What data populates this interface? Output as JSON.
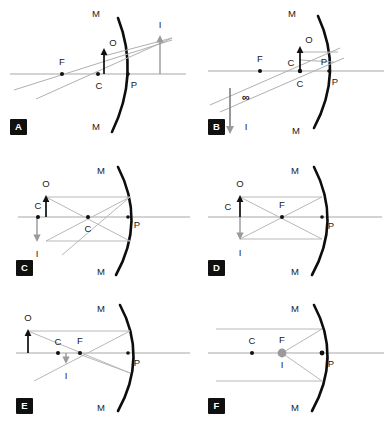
{
  "figure": {
    "colors": {
      "background": "#ffffff",
      "mirror": "#0d0d0d",
      "axis": "#a8a8a8",
      "ray": "#b0b0b0",
      "object_arrow": "#0d0d0d",
      "image_arrow": "#8f8f8f",
      "badge_background": "#101010",
      "badge_text": "#ffffff"
    },
    "symbols": {
      "mirror_top": "M",
      "mirror_bottom": "M",
      "centre_of_curvature": "C",
      "focal_point": "F",
      "pole": "P",
      "object": "O",
      "image": "I",
      "infinity": "∞"
    }
  },
  "panels": [
    {
      "id": "A",
      "badge": "A",
      "caption": "Object between F and P; virtual enlarged upright image",
      "labels": [
        {
          "name": "mirror-top",
          "text": "M"
        },
        {
          "name": "mirror-bottom",
          "text": "M"
        },
        {
          "name": "focal-point",
          "text": "F"
        },
        {
          "name": "centre",
          "text": "C"
        },
        {
          "name": "object",
          "text": "O"
        },
        {
          "name": "pole",
          "text": "P"
        },
        {
          "name": "image",
          "text": "I"
        }
      ]
    },
    {
      "id": "B",
      "badge": "B",
      "caption": "Object at F; reflected rays parallel, image at infinity",
      "labels": [
        {
          "name": "mirror-top",
          "text": "M"
        },
        {
          "name": "mirror-bottom",
          "text": "M"
        },
        {
          "name": "focal-point",
          "text": "F"
        },
        {
          "name": "centre-upper",
          "text": "C"
        },
        {
          "name": "centre-lower",
          "text": "C"
        },
        {
          "name": "object",
          "text": "O"
        },
        {
          "name": "pole-upper",
          "text": "P"
        },
        {
          "name": "pole-lower",
          "text": "P"
        },
        {
          "name": "infinity",
          "text": "∞"
        },
        {
          "name": "image",
          "text": "I"
        }
      ]
    },
    {
      "id": "C",
      "badge": "C",
      "caption": "Object beyond C; real inverted diminished image",
      "labels": [
        {
          "name": "mirror-top",
          "text": "M"
        },
        {
          "name": "mirror-bottom",
          "text": "M"
        },
        {
          "name": "centre-left",
          "text": "C"
        },
        {
          "name": "centre-mid",
          "text": "C"
        },
        {
          "name": "object",
          "text": "O"
        },
        {
          "name": "pole",
          "text": "P"
        },
        {
          "name": "image",
          "text": "I"
        }
      ]
    },
    {
      "id": "D",
      "badge": "D",
      "caption": "Object at C; real inverted image of same size at C",
      "labels": [
        {
          "name": "mirror-top",
          "text": "M"
        },
        {
          "name": "mirror-bottom",
          "text": "M"
        },
        {
          "name": "centre",
          "text": "C"
        },
        {
          "name": "focal-point",
          "text": "F"
        },
        {
          "name": "object",
          "text": "O"
        },
        {
          "name": "pole",
          "text": "P"
        },
        {
          "name": "image",
          "text": "I"
        }
      ]
    },
    {
      "id": "E",
      "badge": "E",
      "caption": "Object far beyond C; real inverted image between C and F",
      "labels": [
        {
          "name": "mirror-top",
          "text": "M"
        },
        {
          "name": "mirror-bottom",
          "text": "M"
        },
        {
          "name": "centre",
          "text": "C"
        },
        {
          "name": "focal-point",
          "text": "F"
        },
        {
          "name": "object",
          "text": "O"
        },
        {
          "name": "pole",
          "text": "P"
        },
        {
          "name": "image",
          "text": "I"
        }
      ]
    },
    {
      "id": "F",
      "badge": "F",
      "caption": "Object at infinity; parallel rays form a point image at F",
      "labels": [
        {
          "name": "mirror-top",
          "text": "M"
        },
        {
          "name": "mirror-bottom",
          "text": "M"
        },
        {
          "name": "centre",
          "text": "C"
        },
        {
          "name": "focal-point",
          "text": "F"
        },
        {
          "name": "pole",
          "text": "P"
        },
        {
          "name": "image",
          "text": "I"
        }
      ]
    }
  ]
}
